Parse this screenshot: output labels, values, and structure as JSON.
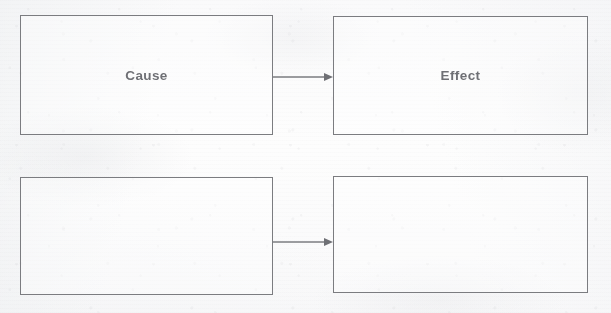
{
  "page": {
    "background_color": "#fbfbfb",
    "line_color": "#7b7c80",
    "text_color": "#6f7075"
  },
  "diagram": {
    "type": "cause-effect",
    "rows": [
      {
        "row_index": 1,
        "cause_box": {
          "label": "Cause",
          "filled": true
        },
        "effect_box": {
          "label": "Effect",
          "filled": true
        },
        "connector": {
          "kind": "arrow",
          "direction": "right",
          "label": ""
        }
      },
      {
        "row_index": 2,
        "cause_box": {
          "label": "",
          "filled": false
        },
        "effect_box": {
          "label": "",
          "filled": false
        },
        "connector": {
          "kind": "arrow",
          "direction": "right",
          "label": ""
        }
      }
    ]
  }
}
